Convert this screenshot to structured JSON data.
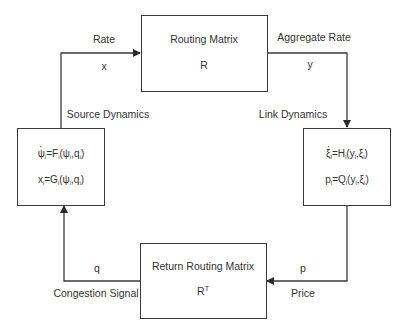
{
  "diagram": {
    "routing_box": {
      "title": "Routing Matrix",
      "symbol": "R"
    },
    "return_box": {
      "title": "Return Routing Matrix",
      "symbol": "R",
      "symbol_sup": "T"
    },
    "source_box": {
      "label": "Source Dynamics",
      "eq1_lhs": "ψ",
      "eq1_sub": "i",
      "eq1_mid": "=F",
      "eq1_args": "(ψ",
      "eq1_args2": ",q",
      "eq1_end": ")",
      "eq2_lhs": "x",
      "eq2_sub": "i",
      "eq2_mid": "=G",
      "eq2_args": "(ψ",
      "eq2_args2": ",q",
      "eq2_end": ")"
    },
    "link_box": {
      "label": "Link Dynamics",
      "eq1_lhs": "ξ",
      "eq1_sub": "l",
      "eq1_mid": "=H",
      "eq1_args": "(y",
      "eq1_args2": ",ξ",
      "eq1_end": ")",
      "eq2_lhs": "p",
      "eq2_sub": "l",
      "eq2_mid": "=Q",
      "eq2_args": "(y",
      "eq2_args2": ",ξ",
      "eq2_end": ")"
    },
    "edges": {
      "rate_label": "Rate",
      "rate_symbol": "x",
      "aggregate_label": "Aggregate Rate",
      "aggregate_symbol": "y",
      "price_label": "Price",
      "price_symbol": "p",
      "congestion_label": "Congestion Signal",
      "congestion_symbol": "q"
    },
    "colors": {
      "line": "#3a3a3a",
      "text": "#333333",
      "background": "#ffffff"
    }
  }
}
